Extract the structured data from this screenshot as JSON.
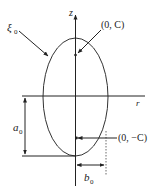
{
  "diagram": {
    "type": "prolate spheroid cross-section (ellipse in r–z plane)",
    "axes": {
      "vertical_label": "z",
      "horizontal_label": "r"
    },
    "labels": {
      "surface": "ξ",
      "surface_sub": "0",
      "focus_top": "(0, C)",
      "focus_bottom": "(0, −C)",
      "semi_major": "a",
      "semi_major_sub": "0",
      "semi_minor": "b",
      "semi_minor_sub": "0"
    },
    "colors": {
      "stroke": "#222222",
      "background": "#ffffff"
    }
  }
}
